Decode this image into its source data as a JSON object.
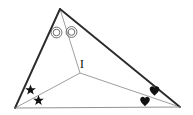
{
  "diagram": {
    "background_color": "#ffffff",
    "canvas": {
      "width": 193,
      "height": 115
    },
    "labels": {
      "incenter": "I"
    },
    "colors": {
      "major_side": "#2b2b2b",
      "base_side": "#8c8c8c",
      "bisector": "#8c8c8c",
      "mark": "#111111",
      "label": "#1a1a1a"
    },
    "vertices": [
      {
        "name": "apex",
        "x": 60,
        "y": 9
      },
      {
        "name": "bottom-left",
        "x": 15,
        "y": 108
      },
      {
        "name": "bottom-right",
        "x": 180,
        "y": 107
      }
    ],
    "incenter_point": {
      "x": 80,
      "y": 73
    },
    "sides": [
      {
        "name": "left-side",
        "from": "bottom-left",
        "to": "apex",
        "weight": 1.9,
        "color": "#2b2b2b"
      },
      {
        "name": "right-side",
        "from": "apex",
        "to": "bottom-right",
        "weight": 1.9,
        "color": "#2b2b2b"
      },
      {
        "name": "base-side",
        "from": "bottom-left",
        "to": "bottom-right",
        "weight": 0.9,
        "color": "#8c8c8c"
      }
    ],
    "bisectors": [
      {
        "name": "bisector-from-apex",
        "from": "apex",
        "to": "incenter",
        "weight": 0.8,
        "color": "#8c8c8c"
      },
      {
        "name": "bisector-from-bottom-left",
        "from": "bottom-left",
        "to": "incenter",
        "weight": 0.8,
        "color": "#8c8c8c"
      },
      {
        "name": "bisector-from-bottom-right",
        "from": "bottom-right",
        "to": "incenter",
        "weight": 0.8,
        "color": "#8c8c8c"
      }
    ],
    "angle_marks": [
      {
        "name": "apex-mark-left",
        "glyph": "double-circle",
        "vertex": "apex",
        "x": 56.5,
        "y": 32.5,
        "outer_radius": 5.4,
        "inner_radius": 3.3
      },
      {
        "name": "apex-mark-right",
        "glyph": "double-circle",
        "vertex": "apex",
        "x": 71.5,
        "y": 32.0,
        "outer_radius": 5.4,
        "inner_radius": 3.3
      },
      {
        "name": "bottom-left-mark-upper",
        "glyph": "star",
        "vertex": "bottom-left",
        "x": 30.5,
        "y": 90.0,
        "size": 5.6
      },
      {
        "name": "bottom-left-mark-lower",
        "glyph": "star",
        "vertex": "bottom-left",
        "x": 38.5,
        "y": 100.5,
        "size": 5.6
      },
      {
        "name": "bottom-right-mark-upper",
        "glyph": "heart",
        "vertex": "bottom-right",
        "x": 154.5,
        "y": 91.0,
        "size": 6.0
      },
      {
        "name": "bottom-right-mark-lower",
        "glyph": "heart",
        "vertex": "bottom-right",
        "x": 145.0,
        "y": 101.5,
        "size": 6.0
      }
    ]
  }
}
